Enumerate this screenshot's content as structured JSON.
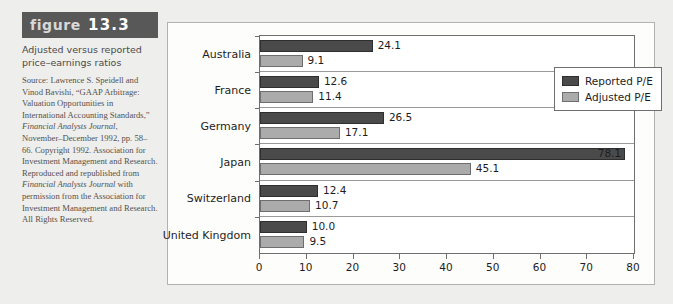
{
  "figure": {
    "tag_word": "figure",
    "tag_number": "13.3",
    "title": "Adjusted versus reported price–earnings ratios",
    "source": "Source: Lawrence S. Speidell and Vinod Bavishi, “GAAP Arbitrage: Valuation Opportunities in International Accounting Standards,” ",
    "source_italic_1": "Financial Analysts Journal",
    "source_2": ", November–December 1992, pp. 58–66. Copyright 1992. Association for Investment Management and Research. Reproduced and republished from ",
    "source_italic_2": "Financial Analysts Journal",
    "source_3": " with permission from the Association for Investment Management and Research. All Rights Reserved."
  },
  "chart_data": {
    "type": "bar",
    "orientation": "horizontal",
    "xlabel": "",
    "ylabel": "",
    "xlim": [
      0,
      80
    ],
    "xticks": [
      0,
      10,
      20,
      30,
      40,
      50,
      60,
      70,
      80
    ],
    "grid": false,
    "legend_position": "upper-right-inside",
    "categories": [
      "Australia",
      "France",
      "Germany",
      "Japan",
      "Switzerland",
      "United Kingdom"
    ],
    "series": [
      {
        "name": "Reported P/E",
        "color": "#4a4a4a",
        "values": [
          24.1,
          12.6,
          26.5,
          78.1,
          12.4,
          10.0
        ],
        "labels": [
          "24.1",
          "12.6",
          "26.5",
          "78.1",
          "12.4",
          "10.0"
        ]
      },
      {
        "name": "Adjusted P/E",
        "color": "#ababab",
        "values": [
          9.1,
          11.4,
          17.1,
          45.1,
          10.7,
          9.5
        ],
        "labels": [
          "9.1",
          "11.4",
          "17.1",
          "45.1",
          "10.7",
          "9.5"
        ]
      }
    ]
  }
}
